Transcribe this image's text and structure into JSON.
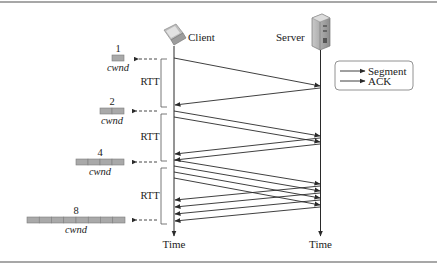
{
  "diagram": {
    "client": {
      "label": "Client",
      "icon": "laptop-icon"
    },
    "server": {
      "label": "Server",
      "icon": "server-icon"
    },
    "time_labels": {
      "client": "Time",
      "server": "Time"
    },
    "legend": {
      "items": [
        {
          "label": "Segment",
          "icon": "arrow-right-icon"
        },
        {
          "label": "ACK",
          "icon": "arrow-right-icon"
        }
      ]
    },
    "rtt_label": "RTT",
    "rtt_brackets": [
      {
        "label": "RTT"
      },
      {
        "label": "RTT"
      },
      {
        "label": "RTT"
      }
    ],
    "cwnd_steps": [
      {
        "value": "1",
        "label": "cwnd",
        "boxes": 1
      },
      {
        "value": "2",
        "label": "cwnd",
        "boxes": 2
      },
      {
        "value": "4",
        "label": "cwnd",
        "boxes": 4
      },
      {
        "value": "8",
        "label": "cwnd",
        "boxes": 8
      }
    ],
    "colors": {
      "line": "#2a2a2a",
      "box_fill": "#a9a9a9",
      "box_stroke": "#7d7d7d",
      "border": "#8a8a8a"
    }
  }
}
